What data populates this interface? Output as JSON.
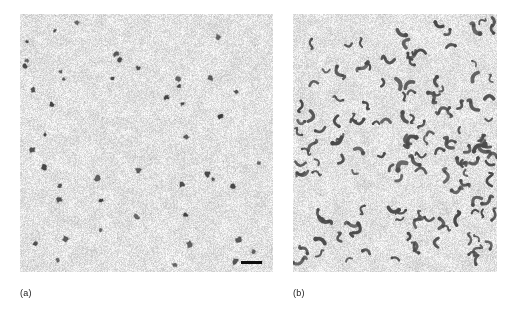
{
  "figure": {
    "type": "electron-micrograph-figure",
    "background_color": "#ffffff",
    "width": 512,
    "height": 312,
    "panels": [
      {
        "id": "panel-a",
        "label": "(a)",
        "x": 20,
        "y": 14,
        "width": 253,
        "height": 258,
        "label_x": 20,
        "label_y": 288,
        "background_color": "#e3e3e3",
        "grain_color": "#9a9a9a",
        "particle_color": "#3a3a3a",
        "particle_shape": "compact-blob",
        "particle_count": 46,
        "particle_size_px": [
          3,
          6
        ],
        "scale_bar": {
          "present": true,
          "x": 241,
          "y": 261,
          "width": 21,
          "height": 3,
          "color": "#0d0d0d",
          "caption": ""
        }
      },
      {
        "id": "panel-b",
        "label": "(b)",
        "x": 293,
        "y": 14,
        "width": 204,
        "height": 258,
        "label_x": 293,
        "label_y": 288,
        "background_color": "#e3e3e3",
        "grain_color": "#9a9a9a",
        "particle_color": "#4a4a4a",
        "particle_shape": "curved-boomerang",
        "particle_count": 135,
        "particle_size_px": [
          6,
          11
        ],
        "scale_bar": {
          "present": false,
          "x": 0,
          "y": 0,
          "width": 0,
          "height": 0,
          "color": "#0d0d0d",
          "caption": ""
        }
      }
    ]
  },
  "chart_data": {
    "type": "image-panels",
    "title": "",
    "panels": [
      {
        "label": "(a)",
        "particle_morphology": "small compact roughly-spherical dark particles",
        "approx_particle_count": 46,
        "relative_density": "low",
        "has_scale_bar": true
      },
      {
        "label": "(b)",
        "particle_morphology": "curved boomerang / C-shaped and S-shaped dark particles",
        "approx_particle_count": 135,
        "relative_density": "high",
        "has_scale_bar": false
      }
    ]
  }
}
